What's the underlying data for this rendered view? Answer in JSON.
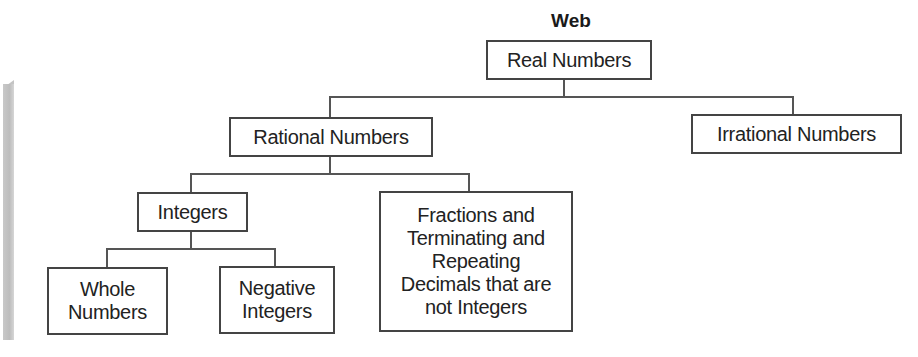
{
  "diagram": {
    "title": "Web",
    "type": "tree",
    "nodes": {
      "real": "Real Numbers",
      "rational": "Rational Numbers",
      "irrational": "Irrational Numbers",
      "integers": "Integers",
      "fractions": "Fractions and\nTerminating and\nRepeating\nDecimals that are\nnot Integers",
      "whole": "Whole\nNumbers",
      "negative": "Negative\nIntegers"
    },
    "edges": [
      [
        "Real Numbers",
        "Rational Numbers"
      ],
      [
        "Real Numbers",
        "Irrational Numbers"
      ],
      [
        "Rational Numbers",
        "Integers"
      ],
      [
        "Rational Numbers",
        "Fractions and Terminating and Repeating Decimals that are not Integers"
      ],
      [
        "Integers",
        "Whole Numbers"
      ],
      [
        "Integers",
        "Negative Integers"
      ]
    ],
    "colors": {
      "border": "#444444",
      "line": "#555555",
      "sidebar": "#c4c4c4"
    }
  }
}
